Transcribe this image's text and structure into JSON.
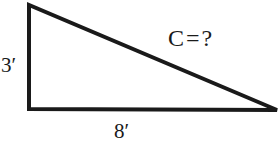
{
  "diagram": {
    "type": "right-triangle",
    "labels": {
      "vertical_leg": "3′",
      "horizontal_leg": "8′",
      "hypotenuse": "C = ?"
    },
    "colors": {
      "stroke": "#1a1a1a",
      "background": "#ffffff"
    }
  }
}
